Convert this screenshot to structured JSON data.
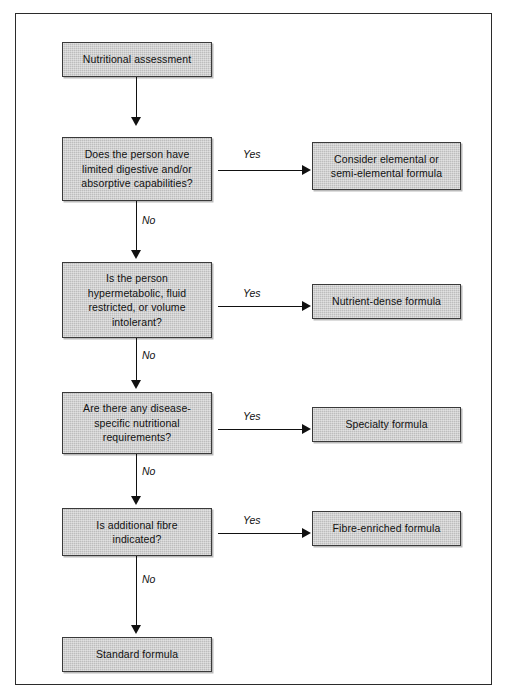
{
  "diagram": {
    "colors": {
      "node_fill": "#bdbdbd",
      "node_border": "#3a3a3a",
      "connector": "#111111",
      "frame": "#2b2b2b",
      "text": "#111111"
    },
    "nodes": {
      "assessment": "Nutritional assessment",
      "question_1": "Does the person have\nlimited digestive and/or\nabsorptive capabilities?",
      "outcome_1": "Consider elemental or\nsemi-elemental formula",
      "question_2": "Is the person\nhypermetabolic, fluid\nrestricted, or volume\nintolerant?",
      "outcome_2": "Nutrient-dense formula",
      "question_3": "Are there any disease-\nspecific nutritional\nrequirements?",
      "outcome_3": "Specialty formula",
      "question_4": "Is additional fibre\nindicated?",
      "outcome_4": "Fibre-enriched formula",
      "standard": "Standard formula"
    },
    "edges": {
      "yes_1": "Yes",
      "yes_2": "Yes",
      "yes_3": "Yes",
      "yes_4": "Yes",
      "no_1": "No",
      "no_2": "No",
      "no_3": "No",
      "no_4": "No"
    }
  }
}
